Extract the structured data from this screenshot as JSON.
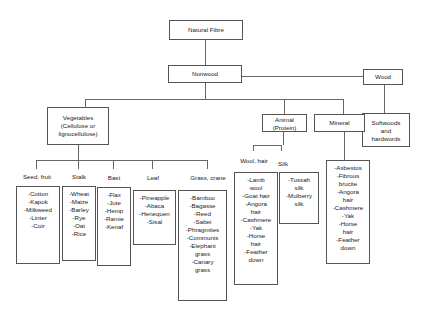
{
  "diagram": {
    "root": "Natural Fibre",
    "level1": {
      "nonwood": "Nonwood",
      "wood": "Wood"
    },
    "wood_child": [
      "Softwoods",
      "and",
      "hardwords"
    ],
    "nonwood_children": {
      "vegetables": [
        "Vegetables",
        "(Cellulose or",
        "lignocellulose)"
      ],
      "animal": [
        "Animal",
        "(Protein)"
      ],
      "mineral": "Mineral"
    },
    "vegetable_categories": [
      {
        "label": "Seed, fruit",
        "items": [
          "-Cotton",
          "-Kapok",
          "-Milkweed",
          "-Linter",
          "-Coir"
        ]
      },
      {
        "label": "Stalk",
        "items": [
          "-Wheat",
          "-Maize",
          "-Barley",
          "-Rye",
          "-Oat",
          "-Rice"
        ]
      },
      {
        "label": "Bast",
        "items": [
          "-Flax",
          "-Jute",
          "-Hemp",
          "-Ramie",
          "-Kenaf"
        ]
      },
      {
        "label": "Leaf",
        "items": [
          "-Pineapple",
          "-Abaca",
          "-Henequen",
          "-Sisal"
        ]
      },
      {
        "label": "Grass, crane",
        "items": [
          "-Bamboo",
          "-Bagasse",
          "-Reed",
          "-Sabei",
          "-Phragmites",
          "-Communis",
          "-Elephant",
          "grass",
          "-Canary",
          "grass"
        ]
      }
    ],
    "animal_categories": [
      {
        "label": "Wool, hair",
        "items": [
          "-Lamb",
          "wool",
          "-Goat hair",
          "-Angora",
          "hair",
          "-Cashmere",
          "-Yak",
          "-Horse",
          "hair",
          "-Feather",
          "down"
        ]
      },
      {
        "label": "Silk",
        "items": [
          "-Tussah",
          "silk",
          "-Mulberry",
          "silk"
        ]
      }
    ],
    "mineral_items": [
      "-Asbestos",
      "-Fibrous",
      "brucite",
      "-Angora",
      "hair",
      "-Cashmere",
      "-Yak",
      "-Horse",
      "hair",
      "-Feather",
      "down"
    ]
  }
}
